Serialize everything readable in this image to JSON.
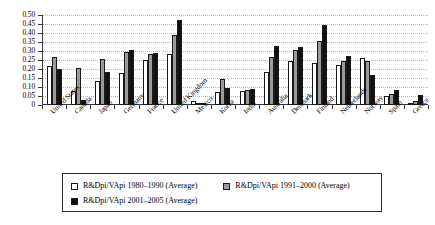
{
  "chart_data": {
    "type": "bar",
    "title": "",
    "xlabel": "",
    "ylabel": "",
    "ylim": [
      0,
      0.5
    ],
    "grid": true,
    "legend_position": "bottom",
    "yticks": [
      "0",
      "0.05",
      "0.10",
      "0.15",
      "0.20",
      "0.25",
      "0.30",
      "0.35",
      "0.40",
      "0.45",
      "0.50"
    ],
    "ytick_values": [
      0,
      0.05,
      0.1,
      0.15,
      0.2,
      0.25,
      0.3,
      0.35,
      0.4,
      0.45,
      0.5
    ],
    "categories": [
      "United States",
      "Canada",
      "Japan",
      "Germany",
      "France",
      "United Kingdom",
      "Mexico",
      "Korea",
      "India",
      "Australia",
      "Denmark",
      "Finland",
      "Netherlands",
      "Norway",
      "Spain",
      "Greece"
    ],
    "series": [
      {
        "name": "R&Dpi/VApi 1980–1990 (Average)",
        "color": "#ffffff",
        "values": [
          0.215,
          0.08,
          0.135,
          0.18,
          0.25,
          0.285,
          0.02,
          0.075,
          0.08,
          0.185,
          0.245,
          0.235,
          0.225,
          0.26,
          0.05,
          0.01
        ]
      },
      {
        "name": "R&Dpi/VApi 1991–2000 (Average)",
        "color": "#9a9a9a",
        "values": [
          0.265,
          0.205,
          0.255,
          0.295,
          0.285,
          0.39,
          0.005,
          0.145,
          0.085,
          0.265,
          0.305,
          0.355,
          0.245,
          0.245,
          0.06,
          0.02
        ]
      },
      {
        "name": "R&Dpi/VApi 2001–2005 (Average)",
        "color": "#111111",
        "values": [
          0.2,
          0.03,
          0.185,
          0.305,
          0.29,
          0.475,
          0.0,
          0.095,
          0.09,
          0.33,
          0.325,
          0.445,
          0.275,
          0.165,
          0.085,
          0.055
        ]
      }
    ]
  },
  "legend": {
    "items": [
      "R&Dpi/VApi 1980–1990 (Average)",
      "R&Dpi/VApi 1991–2000 (Average)",
      "R&Dpi/VApi 2001–2005 (Average)"
    ]
  }
}
